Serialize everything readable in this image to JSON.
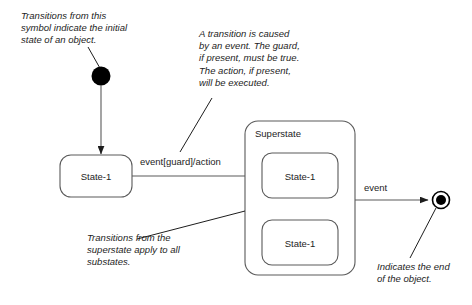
{
  "diagram": {
    "background_color": "#ffffff",
    "stroke_color": "#1d1d1d",
    "notes": {
      "initial": "Transitions from this\nsymbol indicate the initial\nstate of an object.",
      "transition": "A transition is caused\nby an event. The guard,\nif present, must be true.\nThe action, if present,\nwill be executed.",
      "substates": "Transitions from the\nsuperstate apply to all\nsubstates.",
      "final": "Indicates the end\nof the object."
    },
    "states": {
      "initial_state": "initial-state-dot",
      "left_state_label": "State-1",
      "superstate_label": "Superstate",
      "substate_top_label": "State-1",
      "substate_bottom_label": "State-1",
      "final_state": "final-state-bullseye"
    },
    "transitions": {
      "entry_label": "event[guard]/action",
      "exit_label": "event"
    }
  }
}
